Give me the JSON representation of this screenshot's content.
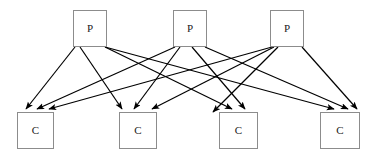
{
  "diagram": {
    "type": "bipartite-graph",
    "background_color": "#ffffff",
    "node_border_color": "#8c8c8c",
    "node_fill_color": "#ffffff",
    "edge_color": "#000000",
    "label_color": "#1a1a1a",
    "producers": [
      {
        "id": "p1",
        "label": "P",
        "x": 73,
        "y": 10,
        "width": 34,
        "height": 37
      },
      {
        "id": "p2",
        "label": "P",
        "x": 173,
        "y": 10,
        "width": 34,
        "height": 37
      },
      {
        "id": "p3",
        "label": "P",
        "x": 270,
        "y": 10,
        "width": 34,
        "height": 37
      }
    ],
    "consumers": [
      {
        "id": "c1",
        "label": "C",
        "x": 17,
        "y": 112,
        "width": 37,
        "height": 37
      },
      {
        "id": "c2",
        "label": "C",
        "x": 119,
        "y": 112,
        "width": 38,
        "height": 37
      },
      {
        "id": "c3",
        "label": "C",
        "x": 219,
        "y": 112,
        "width": 39,
        "height": 37
      },
      {
        "id": "c4",
        "label": "C",
        "x": 320,
        "y": 112,
        "width": 40,
        "height": 37
      }
    ],
    "edges": [
      {
        "from": "p1",
        "to": "c1",
        "x1": 75,
        "y1": 47,
        "x2": 26,
        "y2": 109
      },
      {
        "from": "p1",
        "to": "c2",
        "x1": 80,
        "y1": 47,
        "x2": 122,
        "y2": 109
      },
      {
        "from": "p1",
        "to": "c3",
        "x1": 105,
        "y1": 47,
        "x2": 232,
        "y2": 109
      },
      {
        "from": "p1",
        "to": "c4",
        "x1": 105,
        "y1": 47,
        "x2": 334,
        "y2": 109
      },
      {
        "from": "p2",
        "to": "c1",
        "x1": 175,
        "y1": 47,
        "x2": 37,
        "y2": 109
      },
      {
        "from": "p2",
        "to": "c2",
        "x1": 180,
        "y1": 47,
        "x2": 134,
        "y2": 109
      },
      {
        "from": "p2",
        "to": "c3",
        "x1": 192,
        "y1": 47,
        "x2": 245,
        "y2": 109
      },
      {
        "from": "p2",
        "to": "c4",
        "x1": 205,
        "y1": 47,
        "x2": 348,
        "y2": 109
      },
      {
        "from": "p3",
        "to": "c1",
        "x1": 272,
        "y1": 47,
        "x2": 49,
        "y2": 109
      },
      {
        "from": "p3",
        "to": "c2",
        "x1": 274,
        "y1": 47,
        "x2": 152,
        "y2": 109
      },
      {
        "from": "p3",
        "to": "c3",
        "x1": 278,
        "y1": 47,
        "x2": 213,
        "y2": 112
      },
      {
        "from": "p3",
        "to": "c4",
        "x1": 302,
        "y1": 47,
        "x2": 357,
        "y2": 109
      }
    ]
  }
}
